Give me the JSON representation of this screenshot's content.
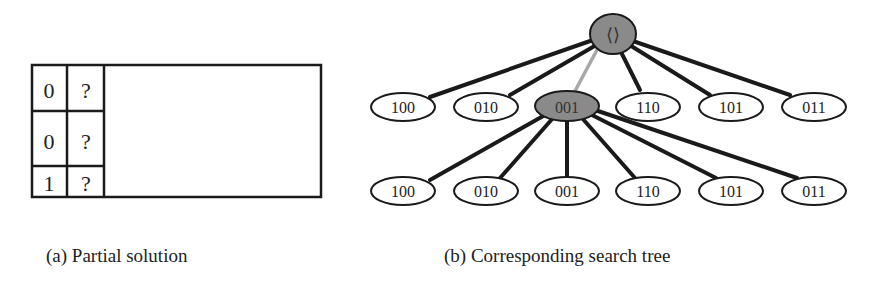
{
  "panel_a": {
    "caption": "(a) Partial solution",
    "grid": [
      [
        "0",
        "?"
      ],
      [
        "0",
        "?"
      ],
      [
        "1",
        "?"
      ]
    ]
  },
  "panel_b": {
    "caption": "(b) Corresponding search tree",
    "root": {
      "label": "⟨⟩",
      "highlighted": true
    },
    "level1": [
      {
        "label": "100",
        "highlighted": false
      },
      {
        "label": "010",
        "highlighted": false
      },
      {
        "label": "001",
        "highlighted": true
      },
      {
        "label": "110",
        "highlighted": false
      },
      {
        "label": "101",
        "highlighted": false
      },
      {
        "label": "011",
        "highlighted": false
      }
    ],
    "level2_parent": "001",
    "level2": [
      {
        "label": "100"
      },
      {
        "label": "010"
      },
      {
        "label": "001"
      },
      {
        "label": "110"
      },
      {
        "label": "101"
      },
      {
        "label": "011"
      }
    ]
  },
  "colors": {
    "highlight_fill": "#8a8a8a",
    "edge": "#1a1a1a",
    "highlight_edge": "#a8a8a8"
  }
}
